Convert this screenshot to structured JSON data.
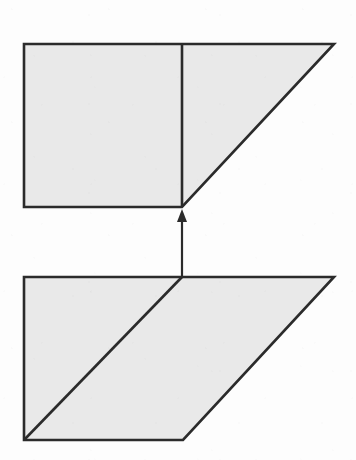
{
  "figure": {
    "kind": "geometry-dissection-diagram",
    "caption": "",
    "width": 356,
    "height": 460,
    "background_color": "#fdfdfd",
    "fill_color": "#e9e9e9",
    "stroke_color": "#2b2b2b",
    "stroke_width": 2.6
  },
  "chart_data": {
    "type": "diagram",
    "title": "",
    "xlabel": "",
    "ylabel": "",
    "grid": false,
    "legend": null,
    "annotations": [],
    "shapes": [
      {
        "id": "upper-figure",
        "name": "square-plus-right-triangle",
        "role": "result",
        "position": "top",
        "points": [
          [
            24,
            44
          ],
          [
            334,
            44
          ],
          [
            182,
            207
          ],
          [
            24,
            207
          ]
        ],
        "fill": "#e9e9e9",
        "stroke": "#2b2b2b",
        "internal_lines": [
          {
            "id": "upper-vertical-divider",
            "name": "vertical-divider",
            "from": [
              182,
              44
            ],
            "to": [
              182,
              207
            ]
          }
        ],
        "parts": [
          {
            "name": "square",
            "points": [
              [
                24,
                44
              ],
              [
                182,
                44
              ],
              [
                182,
                207
              ],
              [
                24,
                207
              ]
            ]
          },
          {
            "name": "right-triangle",
            "points": [
              [
                182,
                44
              ],
              [
                334,
                44
              ],
              [
                182,
                207
              ]
            ]
          }
        ]
      },
      {
        "id": "lower-figure",
        "name": "parallelogram",
        "role": "source",
        "position": "bottom",
        "points": [
          [
            24,
            277
          ],
          [
            334,
            277
          ],
          [
            183,
            440
          ],
          [
            24,
            440
          ]
        ],
        "fill": "#e9e9e9",
        "stroke": "#2b2b2b",
        "internal_lines": [
          {
            "id": "lower-diagonal",
            "name": "diagonal-cut",
            "from": [
              24,
              440
            ],
            "to": [
              182,
              277
            ]
          }
        ],
        "parts": [
          {
            "name": "lower-left-triangle",
            "points": [
              [
                24,
                277
              ],
              [
                182,
                277
              ],
              [
                24,
                440
              ]
            ]
          },
          {
            "name": "lower-right-triangle",
            "points": [
              [
                182,
                277
              ],
              [
                334,
                277
              ],
              [
                183,
                440
              ],
              [
                24,
                440
              ]
            ]
          }
        ]
      }
    ],
    "arrows": [
      {
        "id": "transform-arrow",
        "name": "upward-transform-arrow",
        "direction": "up",
        "from": [
          182,
          277
        ],
        "to": [
          182,
          209
        ],
        "head_at": "to",
        "color": "#2b2b2b",
        "label": ""
      }
    ]
  }
}
